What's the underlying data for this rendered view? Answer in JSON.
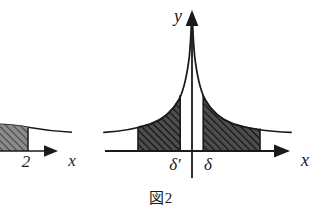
{
  "figure": {
    "caption_label": "図",
    "caption_number": "2",
    "caption_full": "図 2"
  },
  "right_plot": {
    "y_axis_label": "y",
    "x_axis_label": "x",
    "tick_left_label": "δ′",
    "tick_right_label": "δ",
    "origin_x": 192,
    "axis_y": 151,
    "y_axis_top": 12,
    "y_axis_bottom": 178,
    "x_axis_left": 105,
    "x_axis_right": 292,
    "shade_left_start": 138,
    "shade_left_end": 180,
    "shade_right_start": 203,
    "shade_right_end": 260,
    "curve_left_end": 104,
    "curve_right_end": 291,
    "curve_type": "even singular asymptote at origin"
  },
  "left_plot_fragment": {
    "x_axis_label": "x",
    "tick_label": "2",
    "axis_y": 151,
    "x_axis_left": 0,
    "x_axis_right": 55,
    "shade_start": 0,
    "shade_end": 28,
    "curve_right_end": 72
  },
  "colors": {
    "background": "#ffffff",
    "ink": "#1a1a1a",
    "shade_fill": "#4a4a4a",
    "hatch_line": "#111111"
  }
}
